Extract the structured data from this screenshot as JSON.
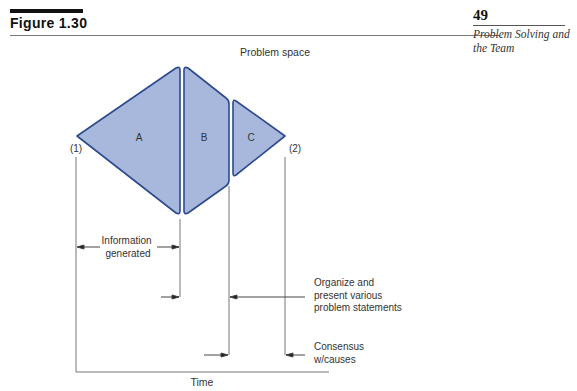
{
  "header": {
    "figure_label": "Figure 1.30",
    "page_number": "49",
    "running_head": "Problem Solving and the Team"
  },
  "diagram": {
    "title": "Problem space",
    "fill_color": "#a7b8dc",
    "stroke_color": "#2d4a8c",
    "line_color": "#777777",
    "regions": [
      {
        "id": "A",
        "label": "A"
      },
      {
        "id": "B",
        "label": "B"
      },
      {
        "id": "C",
        "label": "C"
      }
    ],
    "points": [
      {
        "id": "start",
        "label": "(1)"
      },
      {
        "id": "end",
        "label": "(2)"
      }
    ],
    "annotations": {
      "information_generated": [
        "Information",
        "generated"
      ],
      "organize": [
        "Organize and",
        "present various",
        "problem statements"
      ],
      "consensus": [
        "Consensus",
        "w/causes"
      ]
    },
    "axis_label": "Time"
  }
}
